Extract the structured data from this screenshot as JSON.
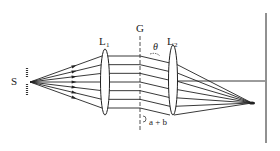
{
  "diagram": {
    "labels": {
      "source": "S",
      "lens1": "L",
      "lens1_sub": "1",
      "grating": "G",
      "angle": "θ",
      "lens2": "L",
      "lens2_sub": "2",
      "period": "a + b"
    },
    "ray_count": 7,
    "colors": {
      "ink": "#222222",
      "background": "#ffffff"
    }
  }
}
